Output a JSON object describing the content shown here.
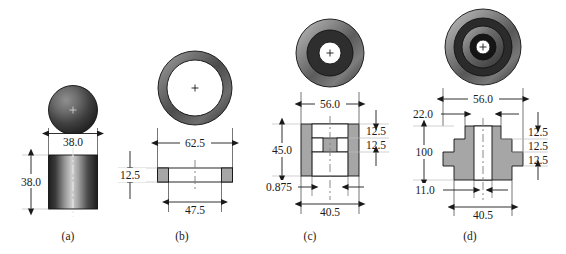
{
  "figure": {
    "title": "",
    "background_color": "#ffffff",
    "line_color": "#1a1a1a",
    "section_fill_color": "#a6a6a6",
    "dark_ring_color": "#2e2e2e",
    "mid_gray_color": "#808080",
    "light_gray_color": "#d9d9d9",
    "parts": [
      {
        "key": "a",
        "label": "(a)",
        "description": "sphere over cylinder",
        "dimensions": [
          {
            "name": "diameter",
            "value": "38.0",
            "orientation": "horizontal"
          },
          {
            "name": "height",
            "value": "38.0",
            "orientation": "vertical"
          }
        ]
      },
      {
        "key": "b",
        "label": "(b)",
        "description": "annular ring washer",
        "dimensions": [
          {
            "name": "outer-diameter",
            "value": "62.5",
            "orientation": "horizontal"
          },
          {
            "name": "inner-diameter",
            "value": "47.5",
            "orientation": "horizontal"
          },
          {
            "name": "thickness",
            "value": "12.5",
            "orientation": "vertical"
          }
        ]
      },
      {
        "key": "c",
        "label": "(c)",
        "description": "spool / H-section bobbin",
        "dimensions": [
          {
            "name": "outer-diameter",
            "value": "56.0",
            "orientation": "horizontal"
          },
          {
            "name": "overall-height",
            "value": "45.0",
            "orientation": "vertical"
          },
          {
            "name": "flange-thickness-top",
            "value": "12.5",
            "orientation": "vertical"
          },
          {
            "name": "flange-thickness-bottom",
            "value": "12.5",
            "orientation": "vertical"
          },
          {
            "name": "wall-thickness",
            "value": "0.875",
            "orientation": "horizontal"
          },
          {
            "name": "bore-diameter",
            "value": "40.5",
            "orientation": "horizontal"
          }
        ]
      },
      {
        "key": "d",
        "label": "(d)",
        "description": "stepped multi-diameter hub",
        "dimensions": [
          {
            "name": "outer-diameter",
            "value": "56.0",
            "orientation": "horizontal"
          },
          {
            "name": "top-step-diameter",
            "value": "22.0",
            "orientation": "horizontal"
          },
          {
            "name": "overall-height",
            "value": "100",
            "orientation": "vertical"
          },
          {
            "name": "step-height-1",
            "value": "12.5",
            "orientation": "vertical"
          },
          {
            "name": "step-height-2",
            "value": "12.5",
            "orientation": "vertical"
          },
          {
            "name": "step-height-3",
            "value": "12.5",
            "orientation": "vertical"
          },
          {
            "name": "bottom-step-offset",
            "value": "11.0",
            "orientation": "horizontal"
          },
          {
            "name": "bore-diameter",
            "value": "40.5",
            "orientation": "horizontal"
          }
        ]
      }
    ]
  }
}
